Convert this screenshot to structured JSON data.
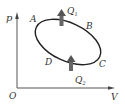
{
  "diagram": {
    "type": "p-V thermodynamic cycle",
    "axes": {
      "y_label": "p",
      "x_label": "V",
      "origin_label": "O"
    },
    "points": [
      {
        "id": "A",
        "label": "A"
      },
      {
        "id": "B",
        "label": "B"
      },
      {
        "id": "C",
        "label": "C"
      },
      {
        "id": "D",
        "label": "D"
      }
    ],
    "heat_flows": [
      {
        "id": "Q1",
        "label": "Q",
        "subscript": "1",
        "direction": "up",
        "location": "top of cycle"
      },
      {
        "id": "Q2",
        "label": "Q",
        "subscript": "2",
        "direction": "up",
        "location": "bottom of cycle"
      }
    ],
    "cycle_shape": "closed tilted ellipse through A, B, C, D",
    "colors": {
      "line": "#333333",
      "arrow": "#555555",
      "background": "#ffffff"
    }
  }
}
